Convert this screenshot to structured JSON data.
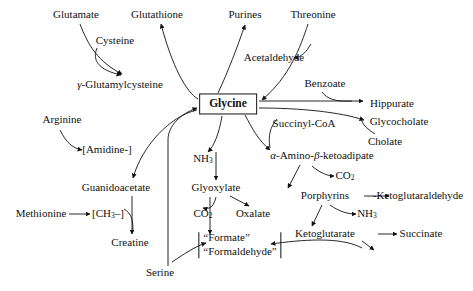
{
  "diagram": {
    "background_color": "#ffffff",
    "line_color": "#111111",
    "center": {
      "label": "Glycine",
      "x": 228,
      "y": 104
    },
    "nodes": [
      {
        "key": "glutamate",
        "label": "Glutamate",
        "x": 76,
        "y": 15,
        "italic_prefix": ""
      },
      {
        "key": "cysteine",
        "label": "Cysteine",
        "x": 115,
        "y": 41,
        "italic_prefix": ""
      },
      {
        "key": "glutathione",
        "label": "Glutathione",
        "x": 157,
        "y": 15,
        "italic_prefix": ""
      },
      {
        "key": "gamma_glutamylcysteine",
        "label": "-Glutamylcysteine",
        "x": 120,
        "y": 85,
        "italic_prefix": "γ"
      },
      {
        "key": "purines",
        "label": "Purines",
        "x": 245,
        "y": 15,
        "italic_prefix": ""
      },
      {
        "key": "threonine",
        "label": "Threonine",
        "x": 313,
        "y": 15,
        "italic_prefix": ""
      },
      {
        "key": "acetaldehyde",
        "label": "Acetaldehyde",
        "x": 274,
        "y": 58,
        "italic_prefix": ""
      },
      {
        "key": "benzoate",
        "label": "Benzoate",
        "x": 325,
        "y": 84,
        "italic_prefix": ""
      },
      {
        "key": "hippurate",
        "label": "Hippurate",
        "x": 392,
        "y": 104,
        "italic_prefix": ""
      },
      {
        "key": "glycocholate",
        "label": "Glycocholate",
        "x": 399,
        "y": 122,
        "italic_prefix": ""
      },
      {
        "key": "cholate",
        "label": "Cholate",
        "x": 385,
        "y": 142,
        "italic_prefix": ""
      },
      {
        "key": "succinyl_coa",
        "label": "Succinyl-CoA",
        "x": 304,
        "y": 124,
        "italic_prefix": ""
      },
      {
        "key": "arginine",
        "label": "Arginine",
        "x": 62,
        "y": 120,
        "italic_prefix": ""
      },
      {
        "key": "amidine",
        "label": "[Amidine-]",
        "x": 107,
        "y": 150,
        "italic_prefix": ""
      },
      {
        "key": "guanidoacetate",
        "label": "Guanidoacetate",
        "x": 116,
        "y": 188,
        "italic_prefix": ""
      },
      {
        "key": "methionine",
        "label": "Methionine",
        "x": 41,
        "y": 214,
        "italic_prefix": ""
      },
      {
        "key": "creatine",
        "label": "Creatine",
        "x": 130,
        "y": 243,
        "italic_prefix": ""
      },
      {
        "key": "serine",
        "label": "Serine",
        "x": 160,
        "y": 273,
        "italic_prefix": ""
      },
      {
        "key": "glyoxylate",
        "label": "Glyoxylate",
        "x": 216,
        "y": 188,
        "italic_prefix": ""
      },
      {
        "key": "oxalate",
        "label": "Oxalate",
        "x": 253,
        "y": 214,
        "italic_prefix": ""
      },
      {
        "key": "alpha_amino_beta_ketoadipate",
        "label": "-Amino-",
        "x": 322,
        "y": 156,
        "italic_prefix": "α"
      },
      {
        "key": "delta_aminolevulinate",
        "label": "-Aminolevulinate",
        "x": 325,
        "y": 196,
        "italic_prefix": "δ"
      },
      {
        "key": "porphyrins",
        "label": "Porphyrins",
        "x": 418,
        "y": 196,
        "italic_prefix": ""
      },
      {
        "key": "alpha_ketoglutaraldehyde",
        "label": "-Ketoglutaraldehyde",
        "x": 325,
        "y": 234,
        "italic_prefix": "α"
      },
      {
        "key": "ketoglutarate",
        "label": "Ketoglutarate",
        "x": 421,
        "y": 234,
        "italic_prefix": ""
      },
      {
        "key": "succinate",
        "label": "Succinate",
        "x": 383,
        "y": 256,
        "italic_prefix": ""
      }
    ],
    "formula_nodes": [
      {
        "key": "methyl_group",
        "label_pre": "[CH",
        "sub": "3",
        "label_post": "–]",
        "x": 108,
        "y": 214
      },
      {
        "key": "ammonia_upper",
        "label_pre": "NH",
        "sub": "3",
        "label_post": "",
        "x": 203,
        "y": 159
      },
      {
        "key": "co2_left",
        "label_pre": "CO",
        "sub": "2",
        "label_post": "",
        "x": 203,
        "y": 214
      },
      {
        "key": "co2_right",
        "label_pre": "CO",
        "sub": "2",
        "label_post": "",
        "x": 345,
        "y": 176
      },
      {
        "key": "ammonia_lower",
        "label_pre": "NH",
        "sub": "3",
        "label_post": "",
        "x": 367,
        "y": 214
      }
    ],
    "ketoadipate_parts": {
      "alpha": "α",
      "mid": "-Amino-",
      "beta": "β",
      "end": "-ketoadipate"
    },
    "bracket_node": {
      "key": "formate-formaldehyde",
      "line1": "“Formate”",
      "line2": "“Formaldehyde”",
      "x": 240,
      "y": 245
    },
    "arrow_descriptions": [
      "Glutamate curves down-right to gamma-Glutamylcysteine",
      "Cysteine curves down to gamma-Glutamylcysteine",
      "gamma-Glutamylcysteine region curves up to Glutathione",
      "Glycine curves up-left to Glutathione",
      "Glycine curves up to Purines",
      "Threonine curves down-left to Glycine",
      "Threonine branch points left to Acetaldehyde",
      "Glycine straight right to Hippurate",
      "Benzoate curves down-right joining Hippurate arrow",
      "Glycine straight right to Glycocholate",
      "Cholate curves up to Glycocholate",
      "Glycine curves down-right to alpha-Amino-beta-ketoadipate",
      "Succinyl-CoA curves down-left to alpha-Amino-beta-ketoadipate",
      "alpha-Amino-beta-ketoadipate branch up-right to CO2",
      "alpha-Amino-beta-ketoadipate down to delta-Aminolevulinate",
      "delta-Aminolevulinate straight right to Porphyrins",
      "delta-Aminolevulinate branch right to NH3",
      "delta-Aminolevulinate down to alpha-Ketoglutaraldehyde",
      "alpha-Ketoglutaraldehyde straight right to Ketoglutarate",
      "alpha-Ketoglutaraldehyde down-right to Succinate",
      "Succinate curves left to Formate/Formaldehyde bracket",
      "Arginine curves down-right to [Amidine-]",
      "Glycine curves down-left to Guanidoacetate",
      "Guanidoacetate straight down to Creatine",
      "[CH3-] curves down-right to Creatine",
      "Glycine down to NH3 then Glyoxylate",
      "Glyoxylate branch down-left to CO2",
      "Glyoxylate branch down-right to Oxalate",
      "Glyoxylate straight down to Formate/Formaldehyde bracket",
      "Serine straight up to Glycine",
      "Serine curves up-right to Formate/Formaldehyde bracket"
    ]
  }
}
